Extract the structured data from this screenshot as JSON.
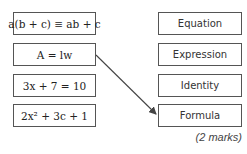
{
  "left_column": {
    "items": [
      {
        "id": "statement-1",
        "text": "a(b + c) ≡ ab + c"
      },
      {
        "id": "statement-2",
        "text": "A = lw"
      },
      {
        "id": "statement-3",
        "text": "3x + 7 = 10"
      },
      {
        "id": "statement-4",
        "text": "2x² + 3c + 1"
      }
    ]
  },
  "right_column": {
    "items": [
      {
        "id": "type-1",
        "label": "Equation"
      },
      {
        "id": "type-2",
        "label": "Expression"
      },
      {
        "id": "type-3",
        "label": "Identity"
      },
      {
        "id": "type-4",
        "label": "Formula"
      }
    ]
  },
  "connections": [
    {
      "from": "A = lw",
      "to": "Formula"
    }
  ],
  "marks_label": "(2 marks)",
  "colors": {
    "border": "#555555",
    "arrow": "#444444",
    "text": "#222222"
  }
}
